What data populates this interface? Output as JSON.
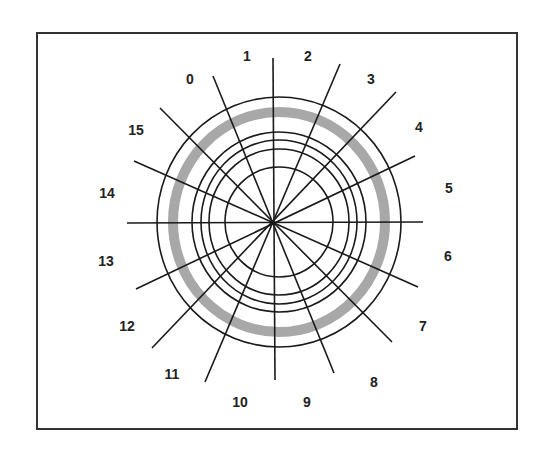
{
  "diagram": {
    "title": "",
    "frame": {
      "x": 37,
      "y": 33,
      "width": 480,
      "height": 396,
      "color": "#333333"
    },
    "hub": {
      "x": 274,
      "y": 222
    },
    "rings": {
      "cx": 279,
      "cy": 222,
      "radii": [
        {
          "rx": 54,
          "ry": 55
        },
        {
          "rx": 70,
          "ry": 73
        },
        {
          "rx": 78,
          "ry": 82
        },
        {
          "rx": 87,
          "ry": 90
        },
        {
          "rx": 122,
          "ry": 125
        }
      ],
      "highlighted_track": {
        "rx": 106,
        "ry": 110,
        "color": "#a8a8a8",
        "width": 10
      }
    },
    "spokes": [
      {
        "x1": 213,
        "y1": 76,
        "x2": 334,
        "y2": 373
      },
      {
        "x1": 273,
        "y1": 58,
        "x2": 275,
        "y2": 380
      },
      {
        "x1": 340,
        "y1": 64,
        "x2": 205,
        "y2": 382
      },
      {
        "x1": 396,
        "y1": 92,
        "x2": 152,
        "y2": 348
      },
      {
        "x1": 415,
        "y1": 156,
        "x2": 136,
        "y2": 289
      },
      {
        "x1": 423,
        "y1": 222,
        "x2": 127,
        "y2": 223
      },
      {
        "x1": 418,
        "y1": 287,
        "x2": 134,
        "y2": 161
      },
      {
        "x1": 392,
        "y1": 342,
        "x2": 160,
        "y2": 108
      }
    ],
    "sector_labels": [
      {
        "text": "0",
        "x": 190,
        "y": 80
      },
      {
        "text": "1",
        "x": 247,
        "y": 57
      },
      {
        "text": "2",
        "x": 308,
        "y": 57
      },
      {
        "text": "3",
        "x": 371,
        "y": 80
      },
      {
        "text": "4",
        "x": 419,
        "y": 128
      },
      {
        "text": "5",
        "x": 449,
        "y": 189
      },
      {
        "text": "6",
        "x": 448,
        "y": 257
      },
      {
        "text": "7",
        "x": 423,
        "y": 327
      },
      {
        "text": "8",
        "x": 374,
        "y": 383
      },
      {
        "text": "9",
        "x": 307,
        "y": 403
      },
      {
        "text": "10",
        "x": 240,
        "y": 403
      },
      {
        "text": "11",
        "x": 172,
        "y": 375
      },
      {
        "text": "12",
        "x": 127,
        "y": 327
      },
      {
        "text": "13",
        "x": 106,
        "y": 262
      },
      {
        "text": "14",
        "x": 107,
        "y": 194
      },
      {
        "text": "15",
        "x": 136,
        "y": 131
      }
    ]
  }
}
